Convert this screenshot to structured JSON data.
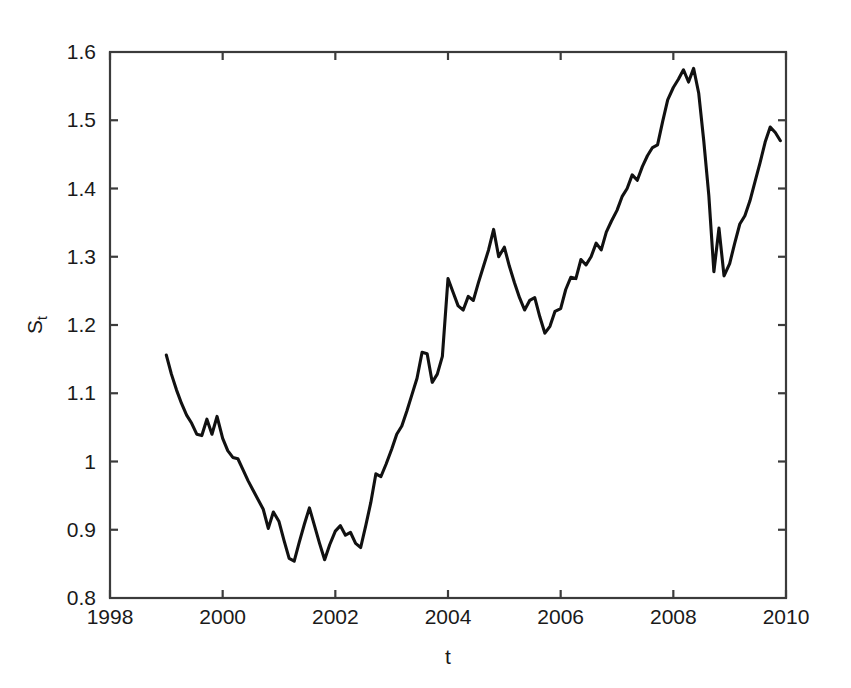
{
  "chart_data": {
    "type": "line",
    "title": "",
    "xlabel": "t",
    "ylabel": "S_t",
    "ylabel_base": "S",
    "ylabel_sub": "t",
    "xlim": [
      1998,
      2010
    ],
    "ylim": [
      0.8,
      1.6
    ],
    "xticks": [
      1998,
      2000,
      2002,
      2004,
      2006,
      2008,
      2010
    ],
    "xtick_labels": [
      "1998",
      "2000",
      "2002",
      "2004",
      "2006",
      "2008",
      "2010"
    ],
    "yticks": [
      0.8,
      0.9,
      1.0,
      1.1,
      1.2,
      1.3,
      1.4,
      1.5,
      1.6
    ],
    "ytick_labels": [
      "0.8",
      "0.9",
      "1",
      "1.1",
      "1.2",
      "1.3",
      "1.4",
      "1.5",
      "1.6"
    ],
    "grid": false,
    "legend": null,
    "line_color": "#111111",
    "axis_color": "#3b3b3b",
    "background_color": "#ffffff",
    "series": [
      {
        "name": "S_t",
        "x": [
          1999.0,
          1999.09,
          1999.18,
          1999.27,
          1999.36,
          1999.45,
          1999.54,
          1999.63,
          1999.72,
          1999.81,
          1999.9,
          2000.0,
          2000.09,
          2000.18,
          2000.27,
          2000.36,
          2000.45,
          2000.54,
          2000.63,
          2000.72,
          2000.81,
          2000.9,
          2001.0,
          2001.09,
          2001.18,
          2001.27,
          2001.36,
          2001.45,
          2001.54,
          2001.63,
          2001.72,
          2001.81,
          2001.9,
          2002.0,
          2002.09,
          2002.18,
          2002.27,
          2002.36,
          2002.45,
          2002.54,
          2002.63,
          2002.72,
          2002.81,
          2002.9,
          2003.0,
          2003.09,
          2003.18,
          2003.27,
          2003.36,
          2003.45,
          2003.54,
          2003.63,
          2003.72,
          2003.81,
          2003.9,
          2004.0,
          2004.09,
          2004.18,
          2004.27,
          2004.36,
          2004.45,
          2004.54,
          2004.63,
          2004.72,
          2004.81,
          2004.9,
          2005.0,
          2005.09,
          2005.18,
          2005.27,
          2005.36,
          2005.45,
          2005.54,
          2005.63,
          2005.72,
          2005.81,
          2005.9,
          2006.0,
          2006.09,
          2006.18,
          2006.27,
          2006.36,
          2006.45,
          2006.54,
          2006.63,
          2006.72,
          2006.81,
          2006.9,
          2007.0,
          2007.09,
          2007.18,
          2007.27,
          2007.36,
          2007.45,
          2007.54,
          2007.63,
          2007.72,
          2007.81,
          2007.9,
          2008.0,
          2008.09,
          2008.18,
          2008.27,
          2008.36,
          2008.45,
          2008.54,
          2008.63,
          2008.72,
          2008.81,
          2008.9,
          2009.0,
          2009.09,
          2009.18,
          2009.27,
          2009.36,
          2009.45,
          2009.54,
          2009.63,
          2009.72,
          2009.81,
          2009.9
        ],
        "y": [
          1.156,
          1.128,
          1.105,
          1.085,
          1.068,
          1.056,
          1.04,
          1.038,
          1.062,
          1.04,
          1.066,
          1.034,
          1.016,
          1.006,
          1.004,
          0.988,
          0.972,
          0.958,
          0.944,
          0.93,
          0.902,
          0.926,
          0.912,
          0.884,
          0.858,
          0.854,
          0.882,
          0.908,
          0.932,
          0.906,
          0.88,
          0.856,
          0.878,
          0.898,
          0.906,
          0.892,
          0.896,
          0.88,
          0.874,
          0.906,
          0.94,
          0.982,
          0.978,
          0.996,
          1.018,
          1.04,
          1.052,
          1.074,
          1.098,
          1.122,
          1.16,
          1.158,
          1.116,
          1.128,
          1.154,
          1.268,
          1.248,
          1.228,
          1.222,
          1.242,
          1.236,
          1.262,
          1.286,
          1.31,
          1.34,
          1.3,
          1.314,
          1.286,
          1.262,
          1.24,
          1.222,
          1.236,
          1.24,
          1.212,
          1.188,
          1.198,
          1.22,
          1.224,
          1.252,
          1.27,
          1.268,
          1.296,
          1.288,
          1.3,
          1.32,
          1.31,
          1.336,
          1.352,
          1.368,
          1.388,
          1.4,
          1.42,
          1.412,
          1.432,
          1.448,
          1.46,
          1.464,
          1.498,
          1.53,
          1.548,
          1.56,
          1.574,
          1.556,
          1.576,
          1.54,
          1.47,
          1.39,
          1.278,
          1.342,
          1.272,
          1.29,
          1.32,
          1.348,
          1.36,
          1.382,
          1.41,
          1.438,
          1.468,
          1.49,
          1.482,
          1.47
        ]
      }
    ]
  }
}
